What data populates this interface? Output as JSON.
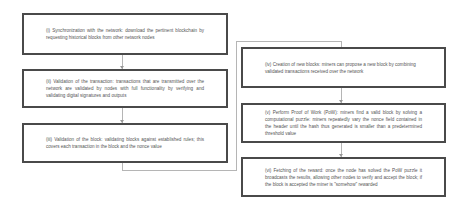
{
  "diagram": {
    "left_column": [
      {
        "id": "i",
        "text": "(i) Synchronization with the network: download the pertinent blockchain by requesting historical blocks from other network nodes"
      },
      {
        "id": "ii",
        "text": "(ii) Validation of the transaction: transactions that are transmitted over the network are validated by nodes with full functionality by verifying and validating digital signatures and outputs"
      },
      {
        "id": "iii",
        "text": "(iii) Validation of the block: validating blocks against established rules; this covers each transaction in the block and the nonce value"
      }
    ],
    "right_column": [
      {
        "id": "iv",
        "text": "(iv) Creation of new blocks: miners can propose a new block by combining validated transactions received over the network"
      },
      {
        "id": "v",
        "text": "(v) Perform Proof of Work (PoW): miners find a valid block by solving a computational puzzle: miners repeatedly vary the nonce field contained in the header until the hash thus generated is smaller than a predetermined threshold value"
      },
      {
        "id": "vi",
        "text": "(vi) Fetching of the reward: once the node has solved the PoW puzzle it broadcasts the results, allowing other nodes to verify and accept the block; if the block is accepted the miner is \"somehow\" rewarded"
      }
    ],
    "colors": {
      "box_border": "#4a4a4a",
      "connector": "#b5b5b5",
      "text": "#555555"
    }
  }
}
